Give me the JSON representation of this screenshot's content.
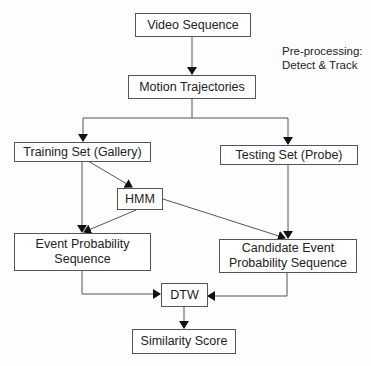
{
  "diagram": {
    "nodes": {
      "video": "Video Sequence",
      "motion": "Motion Trajectories",
      "training": "Training Set (Gallery)",
      "testing": "Testing Set (Probe)",
      "hmm": "HMM",
      "event_seq": "Event Probability\nSequence",
      "candidate_seq": "Candidate Event\nProbability Sequence",
      "dtw": "DTW",
      "similarity": "Similarity Score"
    },
    "annotation": "Pre-processing:\nDetect & Track",
    "edges": [
      {
        "from": "video",
        "to": "motion"
      },
      {
        "from": "motion",
        "to": "training"
      },
      {
        "from": "motion",
        "to": "testing"
      },
      {
        "from": "training",
        "to": "hmm"
      },
      {
        "from": "training",
        "to": "event_seq"
      },
      {
        "from": "hmm",
        "to": "event_seq"
      },
      {
        "from": "hmm",
        "to": "candidate_seq"
      },
      {
        "from": "testing",
        "to": "candidate_seq"
      },
      {
        "from": "event_seq",
        "to": "dtw"
      },
      {
        "from": "candidate_seq",
        "to": "dtw"
      },
      {
        "from": "dtw",
        "to": "similarity"
      }
    ]
  }
}
